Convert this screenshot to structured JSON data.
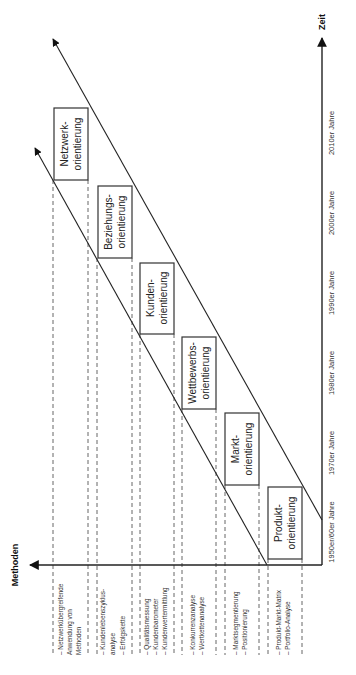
{
  "axes": {
    "y_label": "Methoden",
    "x_label": "Zeit"
  },
  "eras": [
    {
      "label": "1950er/60er Jahre",
      "orientation": [
        "Produkt-",
        "orientierung"
      ],
      "methods": [
        "– Produkt-Markt-Matrix",
        "– Portfolio-Analyse"
      ]
    },
    {
      "label": "1970er Jahre",
      "orientation": [
        "Markt-",
        "orientierung"
      ],
      "methods": [
        "– Marktsegmentierung",
        "– Positionierung"
      ]
    },
    {
      "label": "1980er Jahre",
      "orientation": [
        "Wettbewerbs-",
        "orientierung"
      ],
      "methods": [
        "– Konkurrenzanalyse",
        "– Wertkettenanalyse"
      ]
    },
    {
      "label": "1990er Jahre",
      "orientation": [
        "Kunden-",
        "orientierung"
      ],
      "methods": [
        "– Qualitätsmessung",
        "– Kundenbarometer",
        "– Kundenwertermittlung"
      ]
    },
    {
      "label": "2000er Jahre",
      "orientation": [
        "Beziehungs-",
        "orientierung"
      ],
      "methods": [
        "– Kundenlebenszyklus-",
        "  analyse",
        "– Erfolgskette"
      ]
    },
    {
      "label": "2010er Jahre",
      "orientation": [
        "Netzwerk-",
        "orientierung"
      ],
      "methods": [
        "– Netzwerkübergreifende",
        "  Anwendung von",
        "  Methoden"
      ]
    }
  ]
}
